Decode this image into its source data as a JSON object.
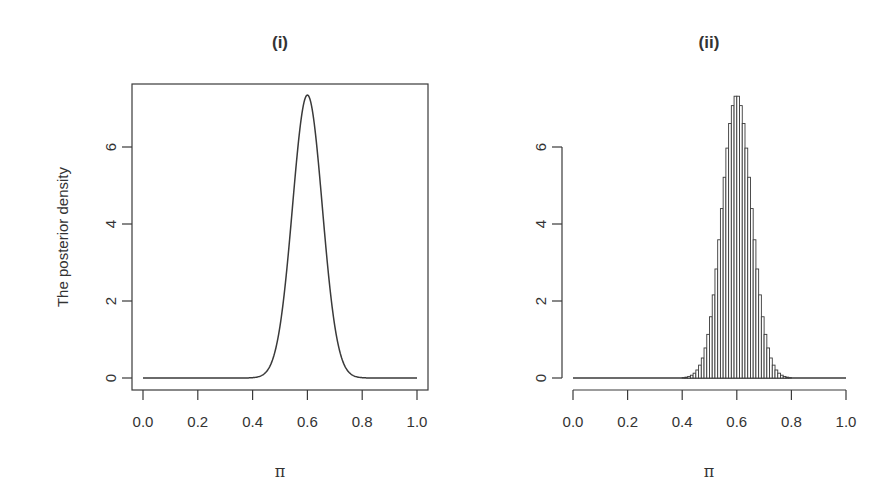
{
  "chart_data": [
    {
      "type": "line",
      "panel": "(i)",
      "title": "(i)",
      "xlabel": "π",
      "ylabel": "The posterior density",
      "xlim": [
        0.0,
        1.0
      ],
      "ylim": [
        0,
        7.6
      ],
      "x_ticks": [
        "0.0",
        "0.2",
        "0.4",
        "0.6",
        "0.8",
        "1.0"
      ],
      "y_ticks": [
        "0",
        "2",
        "4",
        "6"
      ],
      "box": true,
      "grid": false,
      "series": [
        {
          "name": "posterior density",
          "peak_x": 0.6,
          "peak_y": 7.35,
          "sd": 0.0543,
          "x": [
            0.0,
            0.35,
            0.4,
            0.45,
            0.5,
            0.55,
            0.6,
            0.65,
            0.7,
            0.75,
            0.8,
            0.85,
            1.0
          ],
          "y": [
            0.0,
            0.02,
            0.09,
            0.55,
            1.35,
            4.8,
            7.35,
            4.8,
            1.35,
            0.55,
            0.09,
            0.02,
            0.0
          ]
        }
      ]
    },
    {
      "type": "bar",
      "panel": "(ii)",
      "title": "(ii)",
      "xlabel": "π",
      "ylabel": "",
      "xlim": [
        0.0,
        1.0
      ],
      "ylim": [
        0,
        7.6
      ],
      "x_ticks": [
        "0.0",
        "0.2",
        "0.4",
        "0.6",
        "0.8",
        "1.0"
      ],
      "y_ticks": [
        "0",
        "2",
        "4",
        "6"
      ],
      "box": false,
      "grid": false,
      "bin_width": 0.01,
      "description": "Histogram of posterior samples (density scale) closely matching the curve in (i)",
      "series": [
        {
          "name": "sample density histogram",
          "peak_x": 0.6,
          "peak_y": 7.35,
          "sd": 0.0543,
          "x": [
            0.4,
            0.45,
            0.5,
            0.55,
            0.6,
            0.65,
            0.7,
            0.75,
            0.8
          ],
          "y": [
            0.09,
            0.55,
            1.35,
            4.8,
            7.35,
            4.8,
            1.35,
            0.55,
            0.09
          ]
        }
      ]
    }
  ],
  "panels": {
    "left": {
      "title": "(i)",
      "xlabel": "π",
      "ylabel": "The posterior density"
    },
    "right": {
      "title": "(ii)",
      "xlabel": "π"
    }
  }
}
